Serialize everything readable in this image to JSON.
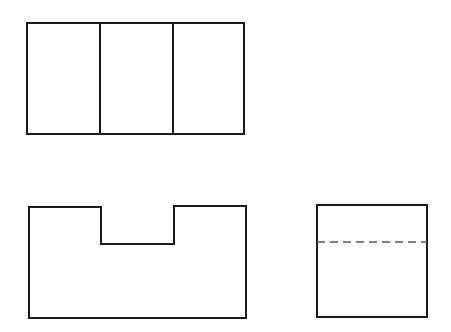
{
  "diagram": {
    "type": "orthographic-projection",
    "colors": {
      "line": "#1a1a1a",
      "hidden_line": "#555555",
      "background": "#ffffff"
    },
    "views": [
      {
        "name": "top-view",
        "outline": [
          27,
          23,
          244,
          134
        ],
        "dividers_x": [
          100,
          173
        ]
      },
      {
        "name": "front-view",
        "outline_points": "29,207 101,207 101,244 174,244 174,206 246,206 246,318 29,318"
      },
      {
        "name": "side-view",
        "outline": [
          317,
          205,
          427,
          317
        ],
        "hidden_line_y": 242
      }
    ]
  }
}
